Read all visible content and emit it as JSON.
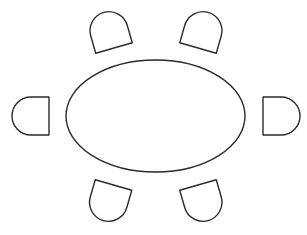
{
  "diagram": {
    "title": "Oval table with six chairs",
    "stroke_color": "#2b2b2b",
    "fill_color": "#ffffff",
    "background": "#ffffff",
    "table": {
      "shape": "ellipse",
      "cx": 155.5,
      "cy": 116,
      "rx": 89.5,
      "ry": 56
    },
    "chair_shape": {
      "width": 38,
      "straight_depth": 18,
      "arc_radius": 19
    },
    "chairs": [
      {
        "id": "top-left",
        "x": 114,
        "y": 48,
        "rotation": -16
      },
      {
        "id": "top-right",
        "x": 198,
        "y": 48,
        "rotation": 16
      },
      {
        "id": "left",
        "x": 49,
        "y": 116,
        "rotation": -90
      },
      {
        "id": "right",
        "x": 263,
        "y": 116,
        "rotation": 90
      },
      {
        "id": "bottom-left",
        "x": 113.5,
        "y": 185,
        "rotation": 196
      },
      {
        "id": "bottom-right",
        "x": 198,
        "y": 185,
        "rotation": 164
      }
    ]
  }
}
